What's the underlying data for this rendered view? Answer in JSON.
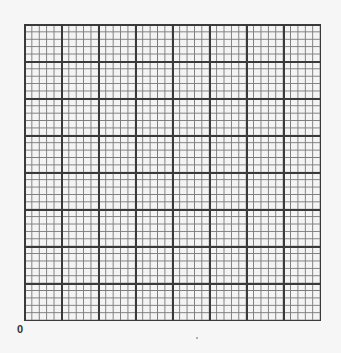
{
  "graph_paper": {
    "major_columns": 8,
    "major_rows": 8,
    "minor_per_major": 5,
    "colors": {
      "background": "#f4f4f4",
      "minor_line": "#7a7a7a",
      "major_line": "#3a3a3a"
    }
  },
  "labels": {
    "origin": "0"
  }
}
